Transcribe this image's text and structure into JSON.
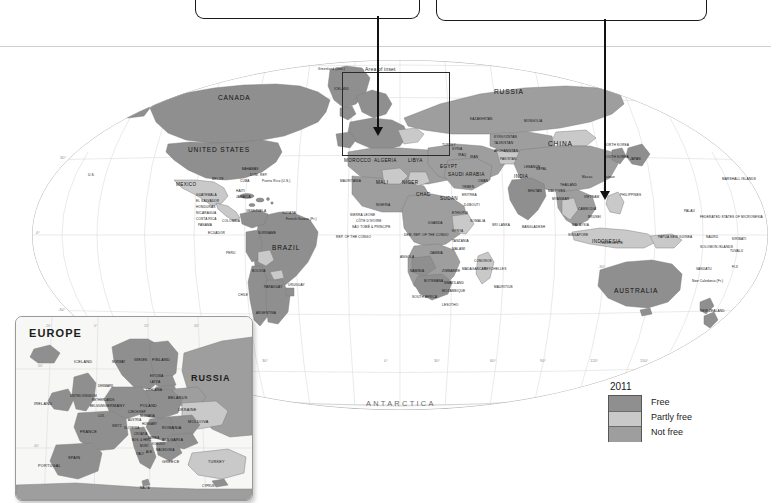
{
  "page": {
    "background_color": "#ffffff"
  },
  "callouts": [
    {
      "id": "callout-1",
      "text": "",
      "leader_target": "iberia-europe-inset-area"
    },
    {
      "id": "callout-2",
      "text": "",
      "leader_target": "vietnam"
    }
  ],
  "main_map": {
    "inset_area_label": "Area of inset",
    "antarctica_label": "ANTARCTICA",
    "latitude_ticks": [
      "30°",
      "0°",
      "-30°"
    ],
    "longitude_ticks": [
      "90°",
      "60°",
      "30°",
      "0°",
      "30°",
      "60°",
      "90°",
      "120°",
      "150°"
    ],
    "labels_major": [
      "CANADA",
      "UNITED STATES",
      "MEXICO",
      "BRAZIL",
      "RUSSIA",
      "CHINA",
      "INDIA",
      "AUSTRALIA",
      "INDONESIA"
    ],
    "labels_americas": [
      "U.S.",
      "BAHAMAS",
      "CUBA",
      "DOM. REP.",
      "HAITI",
      "JAMAICA",
      "Puerto Rico (U.S.)",
      "BELIZE",
      "GUATEMALA",
      "EL SALVADOR",
      "HONDURAS",
      "NICARAGUA",
      "COSTA RICA",
      "PANAMA",
      "COLOMBIA",
      "ECUADOR",
      "PERU",
      "VENEZUELA",
      "GUYANA",
      "SURINAME",
      "French Guiana (Fr.)",
      "BOLIVIA",
      "PARAGUAY",
      "CHILE",
      "ARGENTINA",
      "URUGUAY",
      "ST. KITTS & NEVIS",
      "ANTIGUA & BARBUDA",
      "DOMINICA",
      "ST. LUCIA",
      "BARBADOS",
      "ST. VINCENT & THE GRENADINES",
      "GRENADA",
      "TRINIDAD & TOBAGO"
    ],
    "labels_europe_africa": [
      "Greenland (Den.)",
      "ICELAND",
      "MOROCCO",
      "ALGERIA",
      "LIBYA",
      "EGYPT",
      "MAURITANIA",
      "MALI",
      "NIGER",
      "CHAD",
      "SUDAN",
      "ERITREA",
      "DJIBOUTI",
      "ETHIOPIA",
      "SOMALIA",
      "NIGERIA",
      "GHANA",
      "TOGO",
      "BENIN",
      "CÔTE D'IVOIRE",
      "LIBERIA",
      "SIERRA LEONE",
      "GUINEA",
      "GUINEA-BISSAU",
      "GAMBIA",
      "SENEGAL",
      "BURKINA FASO",
      "CAMEROON",
      "GABON",
      "SÃO TOMÉ & PRÍNCIPE",
      "EQ. GUINEA",
      "REP. OF THE CONGO",
      "DEM. REP. OF THE CONGO",
      "ANGOLA",
      "ZAMBIA",
      "MALAWI",
      "TANZANIA",
      "KENYA",
      "UGANDA",
      "RWANDA",
      "BURUNDI",
      "NAMIBIA",
      "BOTSWANA",
      "ZIMBABWE",
      "MOZAMBIQUE",
      "SOUTH AFRICA",
      "LESOTHO",
      "SWAZILAND",
      "MADAGASCAR",
      "COMOROS",
      "SEYCHELLES",
      "MAURITIUS",
      "CAPE VERDE"
    ],
    "labels_asia_pacific": [
      "KAZAKHSTAN",
      "MONGOLIA",
      "UZBEKISTAN",
      "TURKMENISTAN",
      "KYRGYZSTAN",
      "TAJIKISTAN",
      "AFGHANISTAN",
      "PAKISTAN",
      "IRAN",
      "IRAQ",
      "SYRIA",
      "TURKEY",
      "GEORGIA",
      "ARMENIA",
      "AZERBAIJAN",
      "SAUDI ARABIA",
      "YEMEN",
      "OMAN",
      "U.A.E.",
      "QATAR",
      "KUWAIT",
      "BAHRAIN",
      "JORDAN",
      "ISRAEL",
      "LEBANON",
      "NEPAL",
      "BHUTAN",
      "BANGLADESH",
      "SRI LANKA",
      "MALDIVES",
      "MYANMAR",
      "THAILAND",
      "LAOS",
      "VIETNAM",
      "CAMBODIA",
      "MALAYSIA",
      "BRUNEI",
      "SINGAPORE",
      "PHILIPPINES",
      "TIMOR-LESTE",
      "JAPAN",
      "NORTH KOREA",
      "SOUTH KOREA",
      "Taiwan",
      "Macau",
      "PAPUA NEW GUINEA",
      "NEW ZEALAND",
      "PALAU",
      "FEDERATED STATES OF MICRONESIA",
      "MARSHALL ISLANDS",
      "NAURU",
      "KIRIBATI",
      "TUVALU",
      "SOLOMON ISLANDS",
      "VANUATU",
      "FIJI",
      "SAMOA",
      "TONGA",
      "New Caledonia (Fr.)"
    ]
  },
  "europe_inset": {
    "title": "EUROPE",
    "russia_label": "RUSSIA",
    "latitude_ticks": [
      "60°",
      "40°"
    ],
    "longitude_ticks": [
      "20°",
      "0°",
      "20°",
      "40°"
    ],
    "countries": [
      "ICELAND",
      "IRELAND",
      "UNITED KINGDOM",
      "NORWAY",
      "SWEDEN",
      "FINLAND",
      "ESTONIA",
      "LATVIA",
      "LITHUANIA",
      "BELARUS",
      "POLAND",
      "GERMANY",
      "DENMARK",
      "NETHERLANDS",
      "BELGIUM",
      "LUX.",
      "FRANCE",
      "SWITZ.",
      "AUSTRIA",
      "CZECH REP.",
      "SLOVAKIA",
      "HUNGARY",
      "SLOVENIA",
      "CROATIA",
      "BOS. & HERZ.",
      "SERBIA",
      "MONT.",
      "KOSOVO",
      "ALB.",
      "MACEDONIA",
      "GREECE",
      "BULGARIA",
      "ROMANIA",
      "MOLDOVA",
      "UKRAINE",
      "ITALY",
      "SPAIN",
      "PORTUGAL",
      "TURKEY",
      "CYPRUS",
      "MALTA",
      "RUSSIA"
    ]
  },
  "legend": {
    "year": "2011",
    "items": [
      {
        "label": "Free",
        "color": "#8f8f8f"
      },
      {
        "label": "Partly free",
        "color": "#c9c9c9"
      },
      {
        "label": "Not free",
        "color": "#9e9e9e"
      }
    ]
  },
  "colors": {
    "free": "#8f8f8f",
    "partly_free": "#c9c9c9",
    "not_free": "#9e9e9e",
    "ocean": "#ffffff",
    "graticule": "#d6d6d6",
    "border": "#f2f2f2",
    "outline": "#6f6f6f",
    "text": "#111111"
  }
}
